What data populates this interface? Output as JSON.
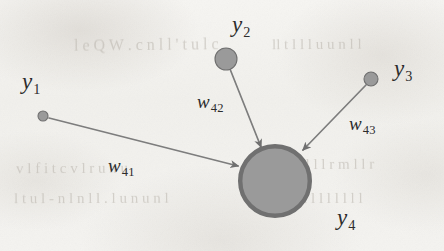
{
  "figure": {
    "type": "neural-network-node-diagram",
    "background_color": "#f3f2ef",
    "node_fill_color": "#9a9a9a",
    "node_stroke_color": "#6f6f6f",
    "edge_color": "#7d7d7d",
    "text_color": "#2c2c2c"
  },
  "nodes": [
    {
      "id": "y1",
      "base": "y",
      "sub": "1",
      "cx": 43,
      "cy": 116,
      "r": 5,
      "label_x": 22,
      "label_y": 70
    },
    {
      "id": "y2",
      "base": "y",
      "sub": "2",
      "cx": 226,
      "cy": 59,
      "r": 11,
      "label_x": 232,
      "label_y": 13
    },
    {
      "id": "y3",
      "base": "y",
      "sub": "3",
      "cx": 371,
      "cy": 79,
      "r": 7,
      "label_x": 394,
      "label_y": 57
    },
    {
      "id": "y4",
      "base": "y",
      "sub": "4",
      "cx": 275,
      "cy": 181,
      "r": 37,
      "label_x": 337,
      "label_y": 206
    }
  ],
  "edges": [
    {
      "id": "w41",
      "base": "w",
      "sub": "41",
      "from": "y1",
      "to": "y4",
      "x1": 49,
      "y1": 118,
      "x2": 238,
      "y2": 166,
      "label_x": 108,
      "label_y": 156,
      "arrowhead": true
    },
    {
      "id": "w42",
      "base": "w",
      "sub": "42",
      "from": "y2",
      "to": "y4",
      "x1": 230,
      "y1": 69,
      "x2": 261,
      "y2": 147,
      "label_x": 197,
      "label_y": 92,
      "arrowhead": true
    },
    {
      "id": "w43",
      "base": "w",
      "sub": "43",
      "from": "y3",
      "to": "y4",
      "x1": 366,
      "y1": 85,
      "x2": 303,
      "y2": 150,
      "label_x": 349,
      "label_y": 114,
      "arrowhead": true
    }
  ],
  "bleed_through_text": [
    {
      "text": "l  e   Q   W .   c n l l   ' t u l c ",
      "x": 74,
      "y": 36,
      "size": 16,
      "rotate": -0.6
    },
    {
      "text": "ll   t l l l u   u n l l ",
      "x": 272,
      "y": 36,
      "size": 15,
      "rotate": -0.4
    },
    {
      "text": "v l f   i   t   c   v l r   u   h u ",
      "x": 16,
      "y": 160,
      "size": 15,
      "rotate": -0.3
    },
    {
      "text": "a   l u l l l   l   r m l l   r ",
      "x": 268,
      "y": 156,
      "size": 15,
      "rotate": -0.3
    },
    {
      "text": "l t u l   -   n l n l l . l u n u   n l ",
      "x": 14,
      "y": 190,
      "size": 15,
      "rotate": -0.2
    },
    {
      "text": "t   n l l l l l l l   l l ",
      "x": 276,
      "y": 190,
      "size": 15,
      "rotate": -0.2
    }
  ]
}
